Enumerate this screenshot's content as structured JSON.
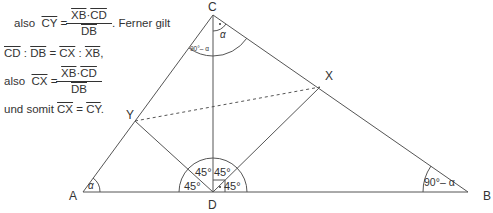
{
  "proof": {
    "line1": {
      "prefix": "also",
      "lhs": "CY",
      "eq": "=",
      "num_a": "XB",
      "dot": "·",
      "num_b": "CD",
      "den": "DB",
      "suffix": ". Ferner gilt"
    },
    "line2": {
      "a": "CD",
      "sep1": " : ",
      "b": "DB",
      "eq": " = ",
      "c": "CX",
      "sep2": " : ",
      "d": "XB",
      "end": ","
    },
    "line3": {
      "prefix": "also",
      "lhs": "CX",
      "eq": "=",
      "num_a": "XB",
      "dot": "·",
      "num_b": "CD",
      "den": "DB"
    },
    "line4": {
      "prefix": "und somit",
      "a": "CX",
      "eq": " = ",
      "b": "CY",
      "end": "."
    }
  },
  "diagram": {
    "points": {
      "A": "A",
      "B": "B",
      "C": "C",
      "D": "D",
      "X": "X",
      "Y": "Y"
    },
    "angles": {
      "alpha_A": "α",
      "alpha_C": "α",
      "c_left": "90°– α",
      "b": "90°– α",
      "d1": "45°",
      "d2": "45°",
      "d3": "45°",
      "d4": "45°"
    },
    "line_color": "#555555"
  }
}
